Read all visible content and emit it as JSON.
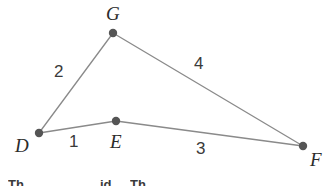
{
  "figure": {
    "type": "geometry-diagram",
    "width": 325,
    "height": 186,
    "background_color": "#ffffff",
    "stroke_color": "#8a8a8a",
    "stroke_width": 1.3,
    "vertex_color": "#555555",
    "vertex_radius": 4.2,
    "label_color": "#2b2b2b",
    "vertices": [
      {
        "name": "D",
        "label": "D",
        "x": 39,
        "y": 133,
        "label_x": 15,
        "label_y": 136
      },
      {
        "name": "E",
        "label": "E",
        "x": 116,
        "y": 121,
        "label_x": 110,
        "label_y": 132
      },
      {
        "name": "G",
        "label": "G",
        "x": 113,
        "y": 33,
        "label_x": 106,
        "label_y": 4
      },
      {
        "name": "F",
        "label": "F",
        "x": 303,
        "y": 146,
        "label_x": 310,
        "label_y": 150
      }
    ],
    "segments": [
      {
        "name": "segment-DE",
        "from": "D",
        "to": "E",
        "label": "1",
        "label_x": 69,
        "label_y": 133
      },
      {
        "name": "segment-DG",
        "from": "D",
        "to": "G",
        "label": "2",
        "label_x": 54,
        "label_y": 63
      },
      {
        "name": "segment-EF",
        "from": "E",
        "to": "F",
        "label": "3",
        "label_x": 196,
        "label_y": 140
      },
      {
        "name": "segment-GF",
        "from": "G",
        "to": "F",
        "label": "4",
        "label_x": 194,
        "label_y": 55
      }
    ],
    "cut_off_text": {
      "visible": true,
      "fragments": [
        {
          "text": "Th",
          "x": 8,
          "y": 178
        },
        {
          "text": "id",
          "x": 100,
          "y": 178
        },
        {
          "text": "Th",
          "x": 130,
          "y": 178
        }
      ]
    }
  }
}
